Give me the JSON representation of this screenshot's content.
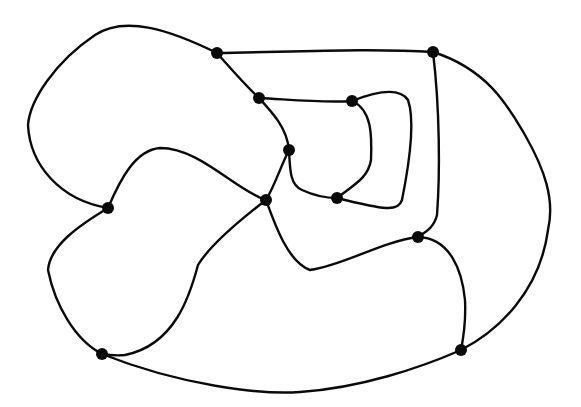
{
  "diagram": {
    "type": "planar-graph",
    "colors": {
      "background": "#ffffff",
      "stroke": "#0a0a0a",
      "node": "#0a0a0a"
    },
    "nodes": [
      {
        "id": "A",
        "x": 217,
        "y": 53
      },
      {
        "id": "B",
        "x": 433,
        "y": 52
      },
      {
        "id": "C",
        "x": 259,
        "y": 98
      },
      {
        "id": "D",
        "x": 352,
        "y": 101
      },
      {
        "id": "E",
        "x": 289,
        "y": 150
      },
      {
        "id": "F",
        "x": 108,
        "y": 208
      },
      {
        "id": "G",
        "x": 266,
        "y": 200
      },
      {
        "id": "H",
        "x": 337,
        "y": 198
      },
      {
        "id": "I",
        "x": 418,
        "y": 237
      },
      {
        "id": "J",
        "x": 102,
        "y": 354
      },
      {
        "id": "K",
        "x": 461,
        "y": 350
      }
    ],
    "edges": [
      {
        "from": "A",
        "to": "F",
        "d": "M217,53 C170,30 125,15 95,35 C55,62 30,100 28,125 C30,165 60,200 108,208"
      },
      {
        "from": "A",
        "to": "B",
        "d": "M217,53 C290,52 370,48 433,52"
      },
      {
        "from": "A",
        "to": "C",
        "d": "M217,53 C232,70 245,85 259,98"
      },
      {
        "from": "C",
        "to": "D",
        "d": "M259,98 C295,100 325,103 352,101"
      },
      {
        "from": "C",
        "to": "E",
        "d": "M259,98 C272,112 287,128 289,150"
      },
      {
        "from": "D",
        "to": "H",
        "d": "M352,101 C372,110 372,135 371,160 C368,178 355,184 337,198"
      },
      {
        "from": "D",
        "to": "H",
        "d": "M352,101 C380,90 400,88 408,100 C415,120 410,160 402,200 C398,212 385,210 337,198"
      },
      {
        "from": "E",
        "to": "H",
        "d": "M289,150 C290,170 290,185 302,190 C315,196 325,198 337,198"
      },
      {
        "from": "E",
        "to": "G",
        "d": "M289,150 C280,168 275,185 266,200"
      },
      {
        "from": "F",
        "to": "G",
        "d": "M108,208 C120,180 135,150 160,148 C200,148 235,190 266,200"
      },
      {
        "from": "F",
        "to": "J",
        "d": "M108,208 C80,225 50,245 48,270 C55,305 75,340 102,354"
      },
      {
        "from": "G",
        "to": "J",
        "d": "M266,200 C240,220 210,245 198,265 C190,295 175,345 125,355 C115,356 108,355 102,354"
      },
      {
        "from": "G",
        "to": "I",
        "d": "M266,200 C275,225 288,262 310,270 C345,265 380,242 418,237"
      },
      {
        "from": "B",
        "to": "I",
        "d": "M433,52 C440,110 440,175 437,215 C434,228 425,232 418,237"
      },
      {
        "from": "B",
        "to": "K",
        "d": "M433,52 C490,70 510,110 525,135 C545,170 555,200 548,230 C540,290 500,330 461,350"
      },
      {
        "from": "I",
        "to": "K",
        "d": "M418,237 C450,238 462,270 465,300 C466,320 464,335 461,350"
      },
      {
        "from": "J",
        "to": "K",
        "d": "M102,354 C180,385 260,395 300,392 C360,388 420,368 461,350"
      }
    ]
  }
}
